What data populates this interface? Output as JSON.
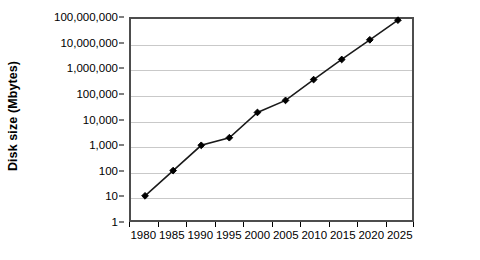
{
  "chart_data": {
    "type": "line",
    "title": "",
    "subtitle": "",
    "xlabel": "",
    "ylabel": "Disk size (Mbytes)",
    "x": [
      1980,
      1985,
      1990,
      1995,
      2000,
      2005,
      2010,
      2015,
      2020,
      2025
    ],
    "categories": [
      "1980",
      "1985",
      "1990",
      "1995",
      "2000",
      "2005",
      "2010",
      "2015",
      "2020",
      "2025"
    ],
    "values": [
      10,
      100,
      1000,
      2000,
      20000,
      60000,
      400000,
      2500000,
      15000000,
      90000000
    ],
    "series": [
      {
        "name": "Disk size",
        "values": [
          10,
          100,
          1000,
          2000,
          20000,
          60000,
          400000,
          2500000,
          15000000,
          90000000
        ]
      }
    ],
    "yscale": "log",
    "ylim": [
      1,
      100000000
    ],
    "ytick_labels": [
      "100,000,000",
      "10,000,000",
      "1,000,000",
      "100,000",
      "10,000",
      "1,000",
      "100",
      "10",
      "1"
    ],
    "ytick_values": [
      100000000,
      10000000,
      1000000,
      100000,
      10000,
      1000,
      100,
      10,
      1
    ],
    "grid": true,
    "grid_axis": "y",
    "legend": false,
    "legend_position": "none",
    "marker": "diamond",
    "line_color": "#1a1a1a",
    "marker_color": "#000000",
    "grid_color": "#c9c9c9",
    "border_color": "#4d4d4d",
    "plot_background": "#ffffff"
  },
  "axes": {
    "y_title": "Disk size (Mbytes)"
  }
}
